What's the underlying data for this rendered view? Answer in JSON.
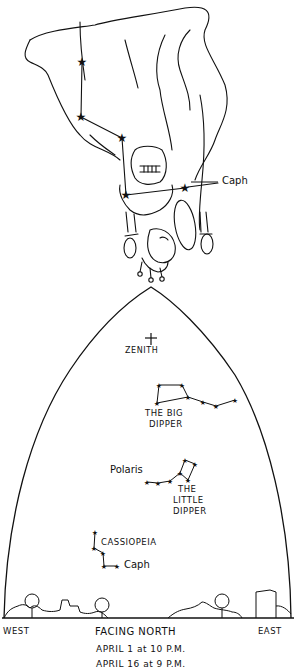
{
  "illustration": {
    "subject": "Cassiopeia (queen) figure drawn upside down with constellation stars",
    "star_label": "Caph"
  },
  "sky_chart": {
    "zenith_label": "ZENITH",
    "constellations": [
      {
        "name_line1": "THE BIG",
        "name_line2": "DIPPER"
      },
      {
        "name_line1": "THE",
        "name_line2": "LITTLE",
        "name_line3": "DIPPER"
      },
      {
        "name_line1": "CASSIOPEIA"
      }
    ],
    "star_labels": {
      "polaris": "Polaris",
      "caph": "Caph"
    },
    "directions": {
      "west": "WEST",
      "facing": "FACING NORTH",
      "east": "EAST"
    },
    "times": [
      "APRIL 1 at 10 P.M.",
      "APRIL 16 at 9 P.M."
    ]
  },
  "colors": {
    "ink": "#111111",
    "background": "#ffffff"
  }
}
